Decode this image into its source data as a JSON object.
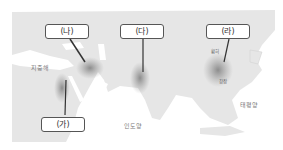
{
  "map": {
    "title": "",
    "civilizations": [
      {
        "id": "ga",
        "label": "(가)"
      },
      {
        "id": "na",
        "label": "(나)"
      },
      {
        "id": "da",
        "label": "(다)"
      },
      {
        "id": "ra",
        "label": "(라)"
      }
    ],
    "seas": {
      "mediterranean": "지중해",
      "indian_ocean": "인도양",
      "pacific": "태평양"
    },
    "rivers": {
      "huanghe": "황허",
      "changjiang": "창장"
    },
    "colors": {
      "land": "#e6e6e6",
      "sea": "#ffffff",
      "region_shading": "#8a8a8a",
      "pointer": "#333333",
      "label_border": "#555555"
    }
  }
}
